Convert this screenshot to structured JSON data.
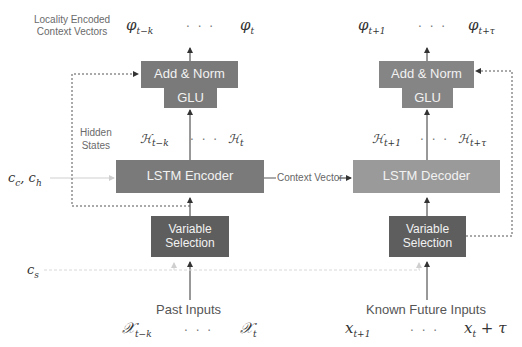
{
  "diagram": {
    "title_left": {
      "line1": "Locality Encoded",
      "line2": "Context Vectors"
    },
    "outputs_past": {
      "first": "φ",
      "first_sub": "t−k",
      "ellipsis": "· · ·",
      "last": "φ",
      "last_sub": "t"
    },
    "outputs_future": {
      "first": "φ",
      "first_sub": "t+1",
      "ellipsis": "· · ·",
      "last": "φ",
      "last_sub": "t+τ"
    },
    "encoder_side": {
      "add_norm": "Add & Norm",
      "glu": "GLU",
      "lstm": "LSTM Encoder",
      "variable_selection_line1": "Variable",
      "variable_selection_line2": "Selection",
      "hidden_states_line1": "Hidden",
      "hidden_states_line2": "States",
      "hidden_first": "ℋ",
      "hidden_first_sub": "t−k",
      "hidden_ellipsis": "· · ·",
      "hidden_last": "ℋ",
      "hidden_last_sub": "t",
      "inputs_label": "Past Inputs",
      "input_first": "𝒳",
      "input_first_sub": "t−k",
      "input_ellipsis": "· · ·",
      "input_last": "𝒳",
      "input_last_sub": "t"
    },
    "decoder_side": {
      "add_norm": "Add & Norm",
      "glu": "GLU",
      "lstm": "LSTM Decoder",
      "variable_selection_line1": "Variable",
      "variable_selection_line2": "Selection",
      "hidden_first": "ℋ",
      "hidden_first_sub": "t+1",
      "hidden_ellipsis": "· · ·",
      "hidden_last": "ℋ",
      "hidden_last_sub": "t+τ",
      "inputs_label": "Known Future Inputs",
      "input_first": "x",
      "input_first_sub": "t+1",
      "input_ellipsis": "· · ·",
      "input_last": "x",
      "input_last_sub": "t",
      "input_last_suffix": " + τ"
    },
    "context_vector_label": "Context Vector",
    "cc_ch_label": "c",
    "cc_sub": "c",
    "ch_sub": "h",
    "cs_label": "c",
    "cs_sub": "s",
    "colors": {
      "dark_block": "#5e5e5e",
      "mid_block": "#7a7a7a",
      "light_block": "#9a9a9a",
      "line": "#333333",
      "faint_line": "#cfcfcf"
    }
  }
}
